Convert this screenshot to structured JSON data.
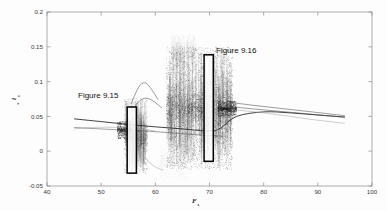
{
  "figure": {
    "background_color": "#fdfdfd",
    "frame_color": "#8a8a8a"
  },
  "annotations": [
    {
      "id": "fig915",
      "text": "Figure 9.15",
      "x": 55.8,
      "y": 0.077
    },
    {
      "id": "fig916",
      "text": "Figure 9.16",
      "x": 70.9,
      "y": 0.135
    }
  ],
  "highlight_boxes": [
    {
      "id": "box915",
      "label": "Figure 9.15",
      "x_range": [
        54.8,
        56.5
      ],
      "y_range": [
        -0.0315,
        0.0635
      ],
      "color": "#000000"
    },
    {
      "id": "box916",
      "label": "Figure 9.16",
      "x_range": [
        69.0,
        70.7
      ],
      "y_range": [
        -0.0145,
        0.1385
      ],
      "color": "#000000"
    }
  ],
  "chart_data": {
    "type": "scatter",
    "title": "",
    "subtitle": "",
    "xlabel": "F",
    "xlabel_sub": "s",
    "ylabel": "i",
    "ylabel_sub": "s",
    "ylabel_sup": "*",
    "xlim": [
      40,
      100
    ],
    "ylim": [
      -0.05,
      0.2
    ],
    "xticks": [
      40,
      50,
      60,
      70,
      80,
      90,
      100
    ],
    "yticks": [
      -0.05,
      0,
      0.05,
      0.1,
      0.15,
      0.2
    ],
    "xtick_labels": [
      "40",
      "50",
      "60",
      "70",
      "80",
      "90",
      "100"
    ],
    "ytick_labels": [
      "-0.05",
      "0",
      "0.05",
      "0.1",
      "0.15",
      "0.2"
    ],
    "grid": false,
    "legend": null,
    "legend_position": "none",
    "series": [
      {
        "name": "main-branch-upper",
        "type": "line",
        "color": "#202020",
        "points": [
          [
            45.0,
            0.0465
          ],
          [
            50.0,
            0.0425
          ],
          [
            55.0,
            0.0385
          ],
          [
            60.0,
            0.035
          ],
          [
            65.0,
            0.032
          ],
          [
            70.0,
            0.029
          ],
          [
            72.0,
            0.033
          ],
          [
            75.0,
            0.05
          ],
          [
            80.0,
            0.0565
          ],
          [
            85.0,
            0.055
          ],
          [
            90.0,
            0.052
          ],
          [
            95.0,
            0.049
          ]
        ]
      },
      {
        "name": "main-branch-lower",
        "type": "line",
        "color": "#4a4a4a",
        "points": [
          [
            45.0,
            0.034
          ],
          [
            50.0,
            0.032
          ],
          [
            55.0,
            0.03
          ],
          [
            58.0,
            0.029
          ],
          [
            62.0,
            0.027
          ],
          [
            66.0,
            0.0245
          ],
          [
            70.0,
            0.0225
          ],
          [
            73.0,
            0.0215
          ]
        ]
      },
      {
        "name": "upper-fan-1",
        "type": "line",
        "color": "#3a3a3a",
        "points": [
          [
            74.0,
            0.07
          ],
          [
            78.0,
            0.066
          ],
          [
            82.0,
            0.0625
          ],
          [
            86.0,
            0.059
          ],
          [
            90.0,
            0.0555
          ],
          [
            95.0,
            0.051
          ]
        ]
      },
      {
        "name": "upper-fan-2",
        "type": "line",
        "color": "#5a5a5a",
        "points": [
          [
            74.0,
            0.064
          ],
          [
            78.0,
            0.0608
          ],
          [
            82.0,
            0.058
          ],
          [
            86.0,
            0.0552
          ],
          [
            90.0,
            0.0522
          ],
          [
            95.0,
            0.0488
          ]
        ]
      },
      {
        "name": "upper-fan-3",
        "type": "line",
        "color": "#9a9a9a",
        "points": [
          [
            74.0,
            0.06
          ],
          [
            79.0,
            0.056
          ],
          [
            84.0,
            0.051
          ],
          [
            89.0,
            0.0455
          ],
          [
            95.0,
            0.04
          ]
        ]
      },
      {
        "name": "left-light-branch",
        "type": "line",
        "color": "#9a9a9a",
        "points": [
          [
            45.0,
            0.032
          ],
          [
            48.0,
            0.034
          ],
          [
            51.0,
            0.0345
          ],
          [
            54.0,
            0.0338
          ],
          [
            57.0,
            0.032
          ],
          [
            60.0,
            0.029
          ]
        ]
      },
      {
        "name": "period2-upper",
        "type": "line",
        "color": "#7a7a7a",
        "points": [
          [
            55.5,
            0.068
          ],
          [
            56.5,
            0.0855
          ],
          [
            57.3,
            0.096
          ],
          [
            58.2,
            0.098
          ],
          [
            59.0,
            0.092
          ],
          [
            59.8,
            0.083
          ],
          [
            60.5,
            0.074
          ]
        ]
      },
      {
        "name": "period2-mid",
        "type": "line",
        "color": "#7a7a7a",
        "points": [
          [
            55.5,
            0.056
          ],
          [
            56.8,
            0.07
          ],
          [
            58.0,
            0.076
          ],
          [
            59.2,
            0.074
          ],
          [
            60.3,
            0.068
          ],
          [
            61.2,
            0.062
          ]
        ]
      },
      {
        "name": "period2-lower",
        "type": "line",
        "color": "#8a8a8a",
        "points": [
          [
            55.2,
            0.012
          ],
          [
            56.5,
            0.002
          ],
          [
            57.8,
            -0.008
          ],
          [
            59.0,
            -0.017
          ],
          [
            60.2,
            -0.0235
          ],
          [
            61.4,
            -0.027
          ]
        ]
      },
      {
        "name": "chaos-band-left",
        "type": "scatter",
        "color": "#2a2a2a",
        "x_range": [
          54.2,
          58.6
        ],
        "y_range": [
          -0.033,
          0.076
        ],
        "density": "high",
        "n_points": 1400
      },
      {
        "name": "chaos-band-main",
        "type": "scatter",
        "color": "#2a2a2a",
        "x_range": [
          62.0,
          74.3
        ],
        "y_range": [
          -0.026,
          0.15
        ],
        "density": "very-high",
        "n_points": 5200
      },
      {
        "name": "chaos-band-sparse-top",
        "type": "scatter",
        "color": "#888888",
        "x_range": [
          63.0,
          67.5
        ],
        "y_range": [
          0.118,
          0.168
        ],
        "density": "low",
        "n_points": 700
      },
      {
        "name": "chaos-band-sparse-bottom",
        "type": "scatter",
        "color": "#777777",
        "x_range": [
          60.8,
          66.0
        ],
        "y_range": [
          -0.04,
          0.01
        ],
        "density": "low",
        "n_points": 600
      },
      {
        "name": "attractor-core-left",
        "type": "scatter",
        "color": "#111111",
        "x_range": [
          53.0,
          55.6
        ],
        "y_range": [
          0.018,
          0.043
        ],
        "density": "very-high",
        "n_points": 900
      },
      {
        "name": "attractor-core-right",
        "type": "scatter",
        "color": "#111111",
        "x_range": [
          71.5,
          75.0
        ],
        "y_range": [
          0.05,
          0.072
        ],
        "density": "very-high",
        "n_points": 1100
      }
    ]
  }
}
